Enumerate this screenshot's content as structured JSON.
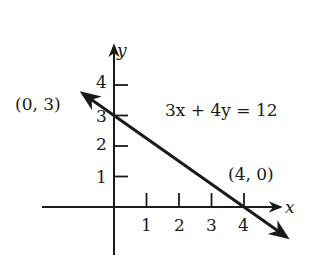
{
  "chart_data": {
    "type": "line",
    "title": "",
    "xlabel": "x",
    "ylabel": "y",
    "x_ticks": [
      "1",
      "2",
      "3",
      "4"
    ],
    "y_ticks": [
      "1",
      "2",
      "3",
      "4"
    ],
    "xlim": [
      -2.2,
      5.2
    ],
    "ylim": [
      -1.5,
      5.0
    ],
    "grid": false,
    "series": [
      {
        "name": "3x + 4y = 12",
        "equation": "3x + 4y = 12",
        "points": [
          [
            0,
            3
          ],
          [
            4,
            0
          ]
        ],
        "extends_both_directions": true
      }
    ],
    "annotations": [
      {
        "text": "(0, 3)",
        "point": [
          0,
          3
        ]
      },
      {
        "text": "(4, 0)",
        "point": [
          4,
          0
        ]
      },
      {
        "text": "3x + 4y = 12"
      }
    ],
    "colors": {
      "ink": "#1a1a1a",
      "background": "#ffffff"
    }
  }
}
